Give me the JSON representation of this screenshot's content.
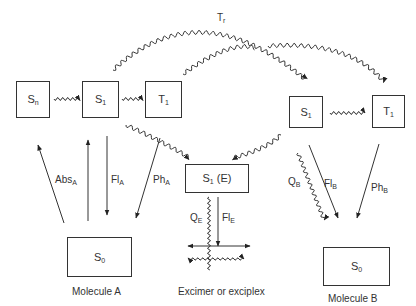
{
  "diagram": {
    "title_label": "Tr",
    "molecules": [
      {
        "id": "A",
        "caption": "Molecule A"
      },
      {
        "id": "E",
        "caption": "Excimer or exciplex"
      },
      {
        "id": "B",
        "caption": "Molecule B"
      }
    ],
    "states": {
      "A_Sn": {
        "main": "S",
        "sub": "n"
      },
      "A_S1": {
        "main": "S",
        "sub": "1"
      },
      "A_T1": {
        "main": "T",
        "sub": "1"
      },
      "A_S0": {
        "main": "S",
        "sub": "0"
      },
      "E_S1": {
        "main": "S",
        "sub": "1",
        "suffix": "(E)"
      },
      "B_S1": {
        "main": "S",
        "sub": "1"
      },
      "B_T1": {
        "main": "T",
        "sub": "1"
      },
      "B_S0": {
        "main": "S",
        "sub": "0"
      }
    },
    "transitions": {
      "absA": {
        "main": "Abs",
        "sub": "A",
        "type": "radiative",
        "from": "A_S0",
        "to": "A_Sn"
      },
      "flA": {
        "main": "Fl",
        "sub": "A",
        "type": "radiative",
        "from": "A_S1",
        "to": "A_S0"
      },
      "phA": {
        "main": "Ph",
        "sub": "A",
        "type": "radiative",
        "from": "A_T1",
        "to": "A_S0"
      },
      "qE": {
        "main": "Q",
        "sub": "E",
        "type": "nonradiative",
        "from": "E_S1",
        "to": "ground"
      },
      "flE": {
        "main": "Fl",
        "sub": "E",
        "type": "radiative",
        "from": "E_S1",
        "to": "ground"
      },
      "qB": {
        "main": "Q",
        "sub": "B",
        "type": "nonradiative",
        "from": "B_S1",
        "to": "B_S0"
      },
      "flB": {
        "main": "Fl",
        "sub": "B",
        "type": "radiative",
        "from": "B_S1",
        "to": "B_S0"
      },
      "phB": {
        "main": "Ph",
        "sub": "B",
        "type": "radiative",
        "from": "B_T1",
        "to": "B_S0"
      },
      "tr": {
        "main": "T",
        "sub": "r",
        "type": "energy-transfer",
        "from": "A_S1",
        "to": "B_S1"
      }
    }
  }
}
